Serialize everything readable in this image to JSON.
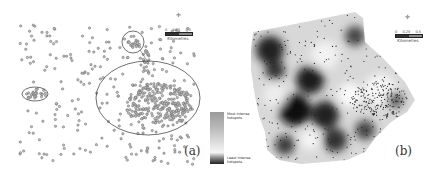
{
  "figure": {
    "panels": [
      {
        "id": "a",
        "label": "(a)",
        "type": "point-distribution-map",
        "description": "Dot map of point locations with ellipses marking clusters",
        "scale_bar": {
          "ticks": [
            "0",
            "0.25",
            "0.5"
          ],
          "unit": "Kilometres"
        },
        "north_arrow": "N"
      },
      {
        "id": "b",
        "label": "(b)",
        "type": "hotspot-intensity-surface",
        "description": "Grayscale interpolated intensity surface with overlaid points",
        "scale_bar": {
          "ticks": [
            "0",
            "0.25",
            "0.5"
          ],
          "unit": "Kilometres"
        },
        "north_arrow": "N"
      }
    ],
    "legend": {
      "top_label_line1": "Most Intense",
      "top_label_line2": "hotspots",
      "bottom_label_line1": "Least Intense",
      "bottom_label_line2": "hotspots"
    }
  }
}
